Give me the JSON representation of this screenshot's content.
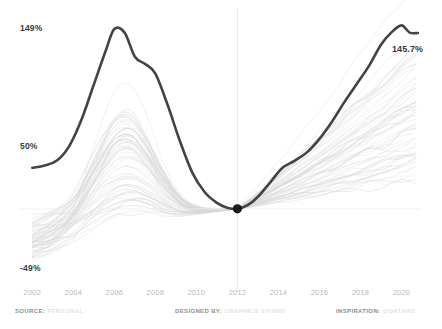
{
  "chart_data": {
    "type": "line",
    "title": "",
    "subtitle": "",
    "xlabel": "",
    "ylabel": "",
    "grid": false,
    "legend_position": "none",
    "xlim": [
      2001.4,
      2021.0
    ],
    "ylim": [
      -49,
      149
    ],
    "xticks": [
      2002,
      2004,
      2006,
      2008,
      2010,
      2012,
      2014,
      2016,
      2018,
      2020
    ],
    "xtick_labels": [
      "2002",
      "2004",
      "2006",
      "2008",
      "2010",
      "2012",
      "2014",
      "2016",
      "2018",
      "2020"
    ],
    "yticks": [
      -49,
      50,
      149
    ],
    "ytick_labels": [
      "-49%",
      "50%",
      "149%"
    ],
    "baseline_year": 2012,
    "baseline_value": 0,
    "origin_marker": {
      "x": 2012,
      "y": 0,
      "label": ""
    },
    "annotations": [
      {
        "text": "145.7%",
        "x": 2020,
        "y": 145.7
      }
    ],
    "highlight_series": {
      "name": "highlighted-line",
      "color": "#434343",
      "x": [
        2002,
        2002.6,
        2003.2,
        2003.8,
        2004.4,
        2005.0,
        2005.6,
        2006.0,
        2006.5,
        2007.0,
        2007.5,
        2008.0,
        2008.6,
        2009.2,
        2009.8,
        2010.4,
        2011.0,
        2011.5,
        2012.0,
        2012.5,
        2013.0,
        2013.6,
        2014.2,
        2014.8,
        2015.4,
        2016.0,
        2016.6,
        2017.2,
        2017.8,
        2018.4,
        2019.0,
        2019.5,
        2020.0,
        2020.4,
        2020.8
      ],
      "values": [
        34,
        36,
        40,
        52,
        74,
        103,
        132,
        149,
        146,
        126,
        120,
        112,
        86,
        56,
        30,
        14,
        5,
        1,
        0,
        3,
        10,
        22,
        34,
        40,
        47,
        58,
        72,
        88,
        103,
        118,
        136,
        146,
        152,
        146,
        145.7
      ]
    },
    "background_series_count": 62,
    "background_color": "#d8d8d8"
  },
  "axis": {
    "y_top_label": "149%",
    "y_mid_label": "50%",
    "y_bottom_label": "-49%"
  },
  "annotation": {
    "end_value": "145.7%"
  },
  "footer": {
    "source_key": "SOURCE:",
    "source_value": "PERSONAL",
    "designer_key": "DESIGNED BY:",
    "designer_value": "GRAPHICS STUDIO",
    "inspiration_key": "INSPIRATION:",
    "inspiration_value": "@DATAVIZ"
  },
  "colors": {
    "highlight": "#434343",
    "background_lines": "#d8d8d8",
    "axis_text": "#b9b9b9",
    "label_text": "#3d3d3d",
    "marker": "#1a1a1a"
  }
}
